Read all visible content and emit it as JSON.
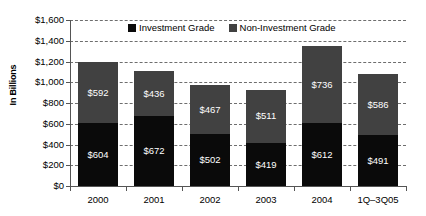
{
  "chart_data": {
    "type": "bar",
    "subtype": "stacked-bar",
    "title": "",
    "xlabel": "",
    "ylabel": "In Billions",
    "ylim": [
      0,
      1600
    ],
    "ytick_step": 200,
    "grid": true,
    "legend_position": "top-center",
    "categories": [
      "2000",
      "2001",
      "2002",
      "2003",
      "2004",
      "1Q–3Q05"
    ],
    "ytick_labels": [
      "$0",
      "$200",
      "$400",
      "$600",
      "$800",
      "$1,000",
      "$1,200",
      "$1,400",
      "$1,600"
    ],
    "ytick_values": [
      0,
      200,
      400,
      600,
      800,
      1000,
      1200,
      1400,
      1600
    ],
    "series": [
      {
        "name": "Investment Grade",
        "color": "#0a0a0a",
        "values": [
          604,
          672,
          502,
          419,
          612,
          491
        ],
        "labels": [
          "$604",
          "$672",
          "$502",
          "$419",
          "$612",
          "$491"
        ]
      },
      {
        "name": "Non-Investment Grade",
        "color": "#414141",
        "values": [
          592,
          436,
          467,
          511,
          736,
          586
        ],
        "labels": [
          "$592",
          "$436",
          "$467",
          "$511",
          "$736",
          "$586"
        ]
      }
    ],
    "totals": [
      1196,
      1108,
      969,
      930,
      1348,
      1077
    ]
  },
  "legend": {
    "items": [
      {
        "label": "Investment Grade",
        "swatch_class": "sw-ig"
      },
      {
        "label": "Non-Investment Grade",
        "swatch_class": "sw-nig"
      }
    ]
  }
}
